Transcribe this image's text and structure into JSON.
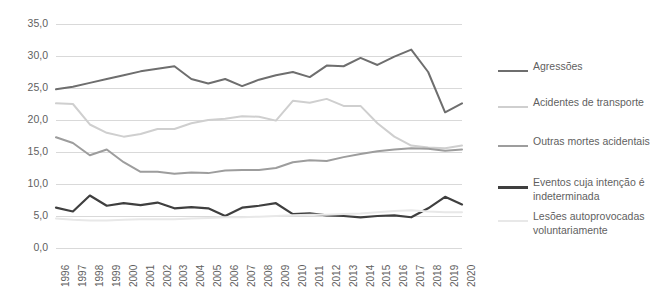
{
  "chart_data": {
    "type": "line",
    "title": "",
    "subtitle": "",
    "xlabel": "",
    "ylabel": "",
    "grid": true,
    "legend_position": "right",
    "xlim": [
      1996,
      2020
    ],
    "ylim": [
      0,
      35
    ],
    "ytick_step": 5,
    "ytick_labels": [
      "0,0",
      "5,0",
      "10,0",
      "15,0",
      "20,0",
      "25,0",
      "30,0",
      "35,0"
    ],
    "ytick_values": [
      0,
      5,
      10,
      15,
      20,
      25,
      30,
      35
    ],
    "categories": [
      "1996",
      "1997",
      "1998",
      "1999",
      "2000",
      "2001",
      "2002",
      "2003",
      "2004",
      "2005",
      "2006",
      "2007",
      "2008",
      "2009",
      "2010",
      "2011",
      "2012",
      "2013",
      "2014",
      "2015",
      "2016",
      "2017",
      "2018",
      "2019",
      "2020"
    ],
    "x": [
      1996,
      1997,
      1998,
      1999,
      2000,
      2001,
      2002,
      2003,
      2004,
      2005,
      2006,
      2007,
      2008,
      2009,
      2010,
      2011,
      2012,
      2013,
      2014,
      2015,
      2016,
      2017,
      2018,
      2019,
      2020
    ],
    "series": [
      {
        "name": "Agressões",
        "color": "#6e6e6e",
        "width": 2.0,
        "values": [
          24.8,
          25.2,
          25.8,
          26.4,
          27.0,
          27.6,
          28.0,
          28.4,
          26.4,
          25.7,
          26.4,
          25.3,
          26.3,
          27.0,
          27.5,
          26.7,
          28.5,
          28.4,
          29.7,
          28.6,
          29.9,
          31.0,
          27.5,
          21.2,
          22.6
        ]
      },
      {
        "name": "Acidentes de transporte",
        "color": "#cfcfcf",
        "width": 2.0,
        "values": [
          22.6,
          22.5,
          19.3,
          18.0,
          17.4,
          17.8,
          18.6,
          18.6,
          19.5,
          20.0,
          20.2,
          20.6,
          20.5,
          19.9,
          23.0,
          22.7,
          23.3,
          22.2,
          22.2,
          19.5,
          17.4,
          16.0,
          15.7,
          15.6,
          16.0
        ]
      },
      {
        "name": "Outras mortes acidentais",
        "color": "#9d9d9d",
        "width": 2.0,
        "values": [
          17.3,
          16.4,
          14.5,
          15.4,
          13.4,
          11.9,
          11.9,
          11.6,
          11.8,
          11.7,
          12.1,
          12.2,
          12.2,
          12.5,
          13.4,
          13.7,
          13.6,
          14.2,
          14.7,
          15.1,
          15.4,
          15.6,
          15.5,
          15.2,
          15.4
        ]
      },
      {
        "name": "Eventos cuja intenção é indeterminada",
        "color": "#3f3f3f",
        "width": 2.2,
        "values": [
          6.3,
          5.7,
          8.2,
          6.6,
          7.0,
          6.7,
          7.1,
          6.2,
          6.4,
          6.2,
          5.0,
          6.3,
          6.6,
          7.0,
          5.3,
          5.4,
          5.1,
          5.0,
          4.8,
          5.0,
          5.1,
          4.8,
          6.2,
          8.0,
          6.8
        ]
      },
      {
        "name": "Lesões autoprovocadas voluntariamente",
        "color": "#e8e8e8",
        "width": 2.0,
        "values": [
          4.6,
          4.4,
          4.3,
          4.3,
          4.4,
          4.5,
          4.5,
          4.5,
          4.6,
          4.7,
          4.8,
          4.8,
          4.9,
          5.0,
          5.1,
          5.2,
          5.2,
          5.3,
          5.4,
          5.6,
          5.8,
          5.9,
          5.7,
          5.6,
          5.6
        ]
      }
    ]
  },
  "legend": {
    "items": [
      {
        "label": "Agressões",
        "color": "#6e6e6e",
        "width": 2.0
      },
      {
        "label": "Acidentes de transporte",
        "color": "#cfcfcf",
        "width": 2.0
      },
      {
        "label": "Outras mortes acidentais",
        "color": "#9d9d9d",
        "width": 2.0
      },
      {
        "label": "Eventos cuja intenção é\nindeterminada",
        "color": "#3f3f3f",
        "width": 2.6
      },
      {
        "label": "Lesões autoprovocadas\nvoluntariamente",
        "color": "#e8e8e8",
        "width": 2.0
      }
    ]
  },
  "axes": {
    "gridline_color": "#d9d9d9",
    "tick_text_color": "#5f5f5f"
  }
}
